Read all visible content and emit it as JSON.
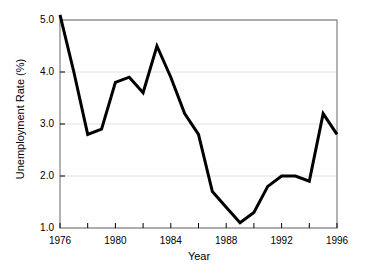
{
  "chart_data": {
    "type": "line",
    "title": "",
    "xlabel": "Year",
    "ylabel": "Unemployment Rate (%)",
    "xlim": [
      1976,
      1996
    ],
    "ylim": [
      1.0,
      5.0
    ],
    "grid": "horizontal",
    "legend": "none",
    "line_color": "#000000",
    "line_width": 3,
    "frame_color": "#808080",
    "gridline_color": "#e0e0e0",
    "x_tick_labels": [
      "1976",
      "1980",
      "1984",
      "1988",
      "1992",
      "1996"
    ],
    "x_tick_values": [
      1976,
      1980,
      1984,
      1988,
      1992,
      1996
    ],
    "x_minor_ticks": [
      1978,
      1982,
      1986,
      1990,
      1994
    ],
    "y_tick_labels": [
      "1.0",
      "2.0",
      "3.0",
      "4.0",
      "5.0"
    ],
    "y_tick_values": [
      1.0,
      2.0,
      3.0,
      4.0,
      5.0
    ],
    "x": [
      1976,
      1977,
      1978,
      1979,
      1980,
      1981,
      1982,
      1983,
      1984,
      1985,
      1986,
      1987,
      1988,
      1989,
      1990,
      1991,
      1992,
      1993,
      1994,
      1995,
      1996
    ],
    "values": [
      5.1,
      4.0,
      2.8,
      2.9,
      3.8,
      3.9,
      3.6,
      4.5,
      3.9,
      3.2,
      2.8,
      1.7,
      1.4,
      1.1,
      1.3,
      1.8,
      2.0,
      2.0,
      1.9,
      3.2,
      2.8
    ],
    "series": [
      {
        "name": "Unemployment Rate",
        "values": [
          5.1,
          4.0,
          2.8,
          2.9,
          3.8,
          3.9,
          3.6,
          4.5,
          3.9,
          3.2,
          2.8,
          1.7,
          1.4,
          1.1,
          1.3,
          1.8,
          2.0,
          2.0,
          1.9,
          3.2,
          2.8
        ]
      }
    ]
  }
}
